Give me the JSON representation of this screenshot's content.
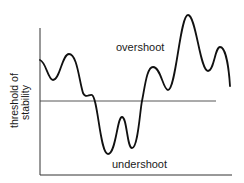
{
  "diagram": {
    "y_axis_label_line1": "threshold of",
    "y_axis_label_line2": "stability",
    "region_above_label": "overshoot",
    "region_below_label": "undershoot",
    "colors": {
      "curve": "#111111",
      "axes": "#333333",
      "threshold_line": "#444444",
      "background": "#ffffff"
    }
  }
}
